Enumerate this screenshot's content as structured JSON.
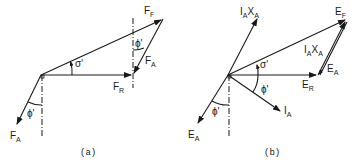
{
  "figure": {
    "panel_a": {
      "caption": "(a)",
      "labels": {
        "ff": {
          "main": "F",
          "sub": "F"
        },
        "fr": {
          "main": "F",
          "sub": "R"
        },
        "fa_top": {
          "main": "F",
          "sub": "A"
        },
        "fa_bottom": {
          "main": "F",
          "sub": "A"
        },
        "sigma": "σ'",
        "phi_top": "ϕ'",
        "phi_bottom": "ϕ'"
      }
    },
    "panel_b": {
      "caption": "(b)",
      "labels": {
        "ef": {
          "main": "E",
          "sub": "F"
        },
        "er": {
          "main": "E",
          "sub": "R"
        },
        "ea_right": {
          "main": "E",
          "sub": "A"
        },
        "ea_bottom": {
          "main": "E",
          "sub": "A"
        },
        "ia": {
          "main": "I",
          "sub": "A"
        },
        "iaxa_top": {
          "i": "I",
          "isub": "A",
          "x": "X",
          "xsub": "A"
        },
        "iaxa_mid": {
          "i": "I",
          "isub": "A",
          "x": "X",
          "xsub": "A"
        },
        "sigma": "σ'",
        "phi_mid": "ϕ'",
        "phi_bottom": "ϕ'"
      }
    }
  }
}
